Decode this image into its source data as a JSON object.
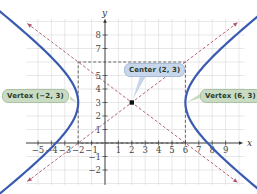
{
  "chart_data": {
    "type": "line",
    "title": "",
    "xlabel": "x",
    "ylabel": "y",
    "xlim": [
      -6,
      10
    ],
    "ylim": [
      -3,
      9
    ],
    "grid": true,
    "x_ticks": [
      "-5",
      "-4",
      "-3",
      "-2",
      "-1",
      "1",
      "2",
      "3",
      "4",
      "5",
      "6",
      "7",
      "8",
      "9"
    ],
    "y_ticks": [
      "-2",
      "-1",
      "1",
      "2",
      "3",
      "4",
      "5",
      "7",
      "8"
    ],
    "equation": "(x-2)^2/16 - (y-3)^2/9 = 1",
    "center": [
      2,
      3
    ],
    "vertices": [
      [
        -2,
        3
      ],
      [
        6,
        3
      ]
    ],
    "asymptotes": [
      {
        "name": "asymptote-positive",
        "slope": 0.75,
        "point": [
          2,
          3
        ]
      },
      {
        "name": "asymptote-negative",
        "slope": -0.75,
        "point": [
          2,
          3
        ]
      }
    ],
    "guide_rectangle": {
      "x": [
        -2,
        6
      ],
      "y": [
        0,
        6
      ]
    },
    "series": [
      {
        "name": "left-branch",
        "color": "#3a5bb0"
      },
      {
        "name": "right-branch",
        "color": "#3a5bb0"
      }
    ],
    "annotations": [
      {
        "text": "Vertex (−2, 3)",
        "point": [
          -2,
          3
        ]
      },
      {
        "text": "Center (2, 3)",
        "point": [
          2,
          3
        ]
      },
      {
        "text": "Vertex (6, 3)",
        "point": [
          6,
          3
        ]
      }
    ]
  },
  "labels": {
    "vertex_left": "Vertex (−2, 3)",
    "center": "Center (2, 3)",
    "vertex_right": "Vertex (6, 3)",
    "x_axis": "x",
    "y_axis": "y"
  },
  "colors": {
    "curve": "#3a5bb0",
    "asymptote": "#b0546e",
    "grid": "#d8d8d8",
    "axis": "#333333",
    "label_green": "#c9dcc3",
    "label_blue": "#c7d6ea"
  }
}
